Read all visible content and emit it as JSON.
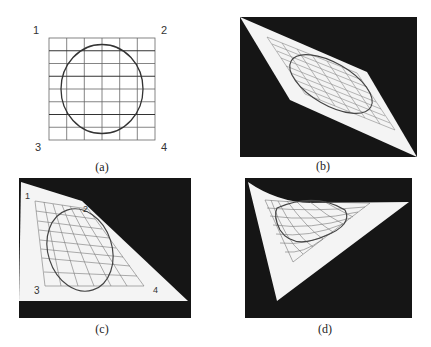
{
  "figure": {
    "panels": [
      {
        "id": "a",
        "caption": "(a)",
        "description": "Original square grid with inscribed circle",
        "corner_labels": [
          "1",
          "2",
          "3",
          "4"
        ],
        "grid": {
          "columns": 6,
          "rows": 8
        }
      },
      {
        "id": "b",
        "caption": "(b)",
        "description": "Affine (parallelogram) warp on black background"
      },
      {
        "id": "c",
        "caption": "(c)",
        "description": "Perspective warp (trapezoid) on black background",
        "corner_labels": [
          "1",
          "2",
          "3",
          "4"
        ]
      },
      {
        "id": "d",
        "caption": "(d)",
        "description": "Nonlinear / curved warp (triangle-like) on black background"
      }
    ],
    "colors": {
      "background": "#ffffff",
      "panel_bg": "#151515",
      "sheet": "#f4f4f4",
      "grid_line": "#555555",
      "curve": "#333333"
    }
  }
}
